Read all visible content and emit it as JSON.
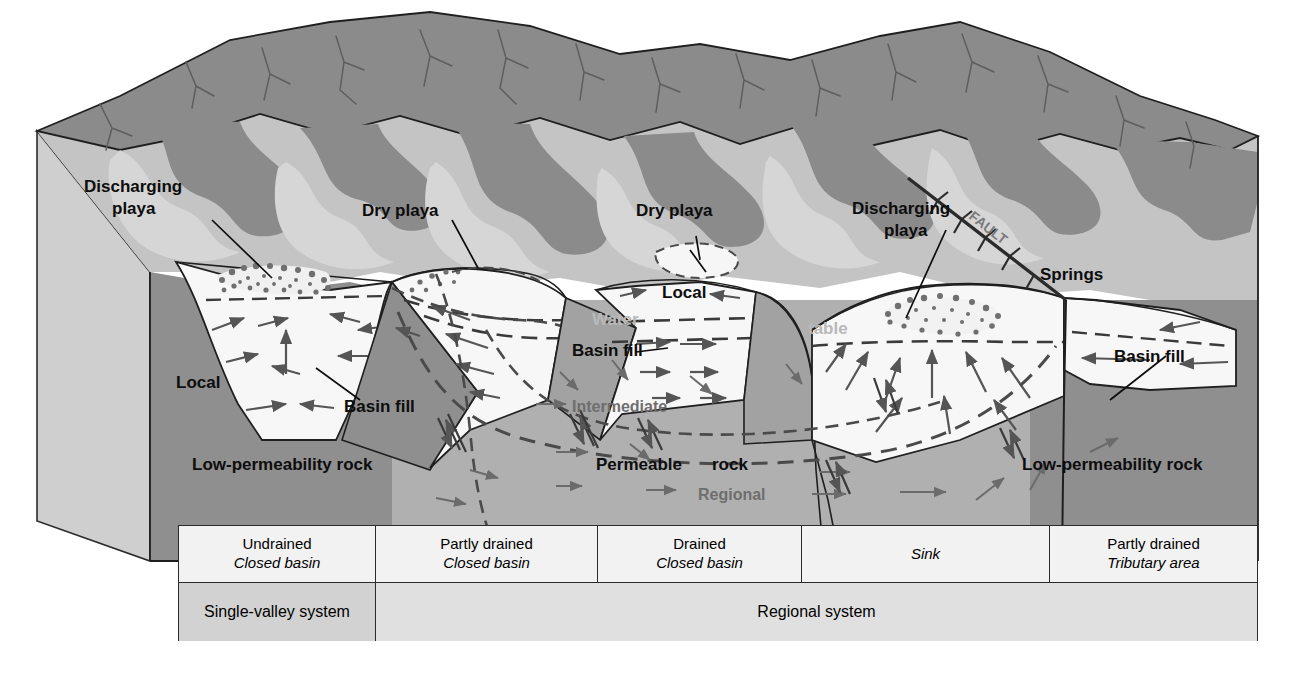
{
  "figure": {
    "type": "block-diagram"
  },
  "labels": {
    "discharging_playa_left": "Discharging\nplaya",
    "discharging_playa_left_l1": "Discharging",
    "discharging_playa_left_l2": "playa",
    "dry_playa_1": "Dry playa",
    "dry_playa_2": "Dry playa",
    "discharging_playa_right_l1": "Discharging",
    "discharging_playa_right_l2": "playa",
    "springs": "Springs",
    "fault": "FAULT",
    "local_left": "Local",
    "local_mid": "Local",
    "basin_fill_1": "Basin fill",
    "basin_fill_2": "Basin fill",
    "basin_fill_3": "Basin fill",
    "water": "Water",
    "table": "table",
    "intermediate": "Intermediate",
    "regional": "Regional",
    "permeable_rock_a": "Permeable",
    "permeable_rock_b": "rock",
    "low_perm_left": "Low-permeability rock",
    "low_perm_right": "Low-permeability rock"
  },
  "legend": {
    "columns": [
      {
        "top": "Undrained",
        "bottom": "Closed basin"
      },
      {
        "top": "Partly drained",
        "bottom": "Closed basin"
      },
      {
        "top": "Drained",
        "bottom": "Closed basin"
      },
      {
        "top": "",
        "bottom": "Sink"
      },
      {
        "top": "Partly drained",
        "bottom": "Tributary area"
      }
    ],
    "systems": [
      {
        "label": "Single-valley system",
        "shaded": true
      },
      {
        "label": "Regional system",
        "shaded": false
      }
    ]
  },
  "colors": {
    "mountain_dark": "#8b8b8b",
    "mountain_mid": "#a9a9a9",
    "alluvium_light": "#c4c4c4",
    "playa_white": "#f4f4f4",
    "basin_fill": "#f7f7f7",
    "permeable_rock": "#b0b0b0",
    "low_perm_rock": "#8f8f8f",
    "block_side": "#cfcfcf",
    "arrow_gray": "#6b6b6b",
    "outline": "#1f1f1f",
    "legend_shade": "#d2d2d2",
    "legend_plain": "#f2f2f2"
  }
}
